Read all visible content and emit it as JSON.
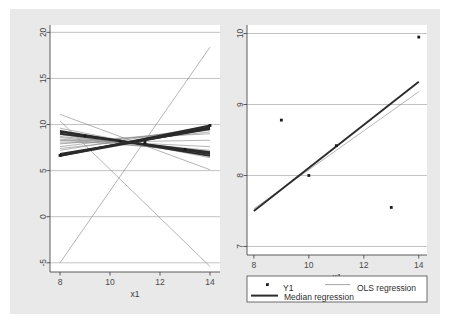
{
  "figure": {
    "background_color": "#e9e9e9",
    "panel_color": "#ffffff",
    "grid_color": "#a9a9a9",
    "axis_color": "#4a4a4a",
    "ols_color": "#8d8d8d",
    "median_color": "#2b2b2b",
    "point_color": "#1a1a1a"
  },
  "chart_data": [
    {
      "id": "left-panel",
      "type": "line",
      "title": "",
      "xlabel": "x1",
      "ylabel": "",
      "xlim": [
        7.6,
        14.4
      ],
      "ylim": [
        -6.0,
        20.8
      ],
      "xticks": [
        8,
        10,
        12,
        14
      ],
      "xticklabels": [
        "8",
        "10",
        "12",
        "14"
      ],
      "yticks": [
        -5,
        0,
        5,
        10,
        15,
        20
      ],
      "yticklabels": [
        "-5",
        "0",
        "5",
        "10",
        "15",
        "20"
      ],
      "grid": true,
      "grid_axis": "y",
      "legend": "none",
      "description": "Fan of repeated OLS and median regression fits from many bootstrap-style samples",
      "series": [
        {
          "name": "OLS regression",
          "style": "thin",
          "color": "#8d8d8d",
          "lines": [
            {
              "x": [
                8,
                14
              ],
              "y": [
                -5.0,
                18.4
              ]
            },
            {
              "x": [
                8,
                14
              ],
              "y": [
                11.1,
                5.1
              ]
            },
            {
              "x": [
                8,
                14
              ],
              "y": [
                9.6,
                6.4
              ]
            },
            {
              "x": [
                8,
                14
              ],
              "y": [
                9.1,
                7.0
              ]
            },
            {
              "x": [
                8,
                14
              ],
              "y": [
                8.9,
                6.7
              ]
            },
            {
              "x": [
                8,
                14
              ],
              "y": [
                8.7,
                7.2
              ]
            },
            {
              "x": [
                8,
                14
              ],
              "y": [
                8.6,
                6.9
              ]
            },
            {
              "x": [
                8,
                14
              ],
              "y": [
                8.4,
                7.6
              ]
            },
            {
              "x": [
                8,
                14
              ],
              "y": [
                8.3,
                7.1
              ]
            },
            {
              "x": [
                8,
                14
              ],
              "y": [
                8.2,
                9.0
              ]
            },
            {
              "x": [
                8,
                14
              ],
              "y": [
                8.0,
                8.3
              ]
            },
            {
              "x": [
                8,
                14
              ],
              "y": [
                7.9,
                9.4
              ]
            },
            {
              "x": [
                8,
                14
              ],
              "y": [
                7.6,
                9.6
              ]
            },
            {
              "x": [
                8,
                14
              ],
              "y": [
                7.4,
                9.2
              ]
            },
            {
              "x": [
                8,
                14
              ],
              "y": [
                7.2,
                9.8
              ]
            },
            {
              "x": [
                8,
                14
              ],
              "y": [
                10.4,
                -5.4
              ]
            }
          ]
        },
        {
          "name": "Median regression",
          "style": "thick",
          "color": "#2b2b2b",
          "lines": [
            {
              "x": [
                8,
                14
              ],
              "y": [
                6.6,
                9.9
              ]
            },
            {
              "x": [
                8,
                14
              ],
              "y": [
                6.7,
                9.7
              ]
            },
            {
              "x": [
                8,
                14
              ],
              "y": [
                6.6,
                9.6
              ]
            },
            {
              "x": [
                8,
                14
              ],
              "y": [
                6.8,
                9.5
              ]
            },
            {
              "x": [
                8,
                14
              ],
              "y": [
                9.3,
                6.6
              ]
            },
            {
              "x": [
                8,
                14
              ],
              "y": [
                9.2,
                6.8
              ]
            },
            {
              "x": [
                8,
                14
              ],
              "y": [
                9.0,
                7.0
              ]
            }
          ]
        }
      ],
      "markers": [
        {
          "x": 8.0,
          "y": 6.65
        },
        {
          "x": 9.0,
          "y": 8.75
        },
        {
          "x": 10.4,
          "y": 8.2
        },
        {
          "x": 11.4,
          "y": 8.05
        },
        {
          "x": 13.0,
          "y": 7.3
        },
        {
          "x": 14.0,
          "y": 9.9
        }
      ]
    },
    {
      "id": "right-panel",
      "type": "scatter",
      "title": "",
      "xlabel": "x1",
      "ylabel": "",
      "xlim": [
        7.75,
        14.3
      ],
      "ylim": [
        6.88,
        10.12
      ],
      "xticks": [
        8,
        10,
        12,
        14
      ],
      "xticklabels": [
        "8",
        "10",
        "12",
        "14"
      ],
      "yticks": [
        7,
        8,
        9,
        10
      ],
      "yticklabels": [
        "7",
        "8",
        "9",
        "10"
      ],
      "grid": true,
      "grid_axis": "y",
      "legend": "below",
      "points": [
        {
          "x": 9.0,
          "y": 8.78
        },
        {
          "x": 10.0,
          "y": 8.0
        },
        {
          "x": 11.0,
          "y": 8.42
        },
        {
          "x": 13.0,
          "y": 7.55
        },
        {
          "x": 14.0,
          "y": 9.95
        }
      ],
      "series": [
        {
          "name": "OLS regression",
          "style": "thin",
          "color": "#8d8d8d",
          "lines": [
            {
              "x": [
                8,
                14
              ],
              "y": [
                7.53,
                9.18
              ]
            }
          ]
        },
        {
          "name": "Median regression",
          "style": "thick",
          "color": "#2b2b2b",
          "lines": [
            {
              "x": [
                8,
                14
              ],
              "y": [
                7.5,
                9.32
              ]
            }
          ]
        }
      ]
    }
  ],
  "legend": {
    "entries": [
      {
        "label": "Y1",
        "marker": "dot"
      },
      {
        "label": "OLS regression",
        "marker": "thin-line"
      },
      {
        "label": "Median regression",
        "marker": "thick-line"
      }
    ]
  }
}
